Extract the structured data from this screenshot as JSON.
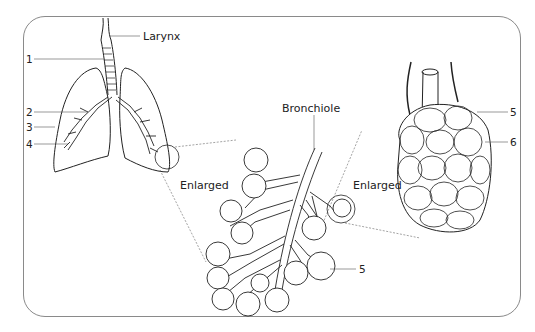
{
  "diagram": {
    "type": "anatomical illustration",
    "labels": {
      "larynx": "Larynx",
      "bronchiole": "Bronchiole",
      "enlarged_left": "Enlarged",
      "enlarged_right": "Enlarged"
    },
    "numbers": {
      "n1": "1",
      "n2": "2",
      "n3": "3",
      "n4": "4",
      "n5_cluster": "5",
      "n5_alveoli": "5",
      "n6": "6"
    },
    "colors": {
      "line": "#222222",
      "leader": "#555555",
      "frame": "#8a8a8a",
      "background": "#ffffff"
    }
  }
}
